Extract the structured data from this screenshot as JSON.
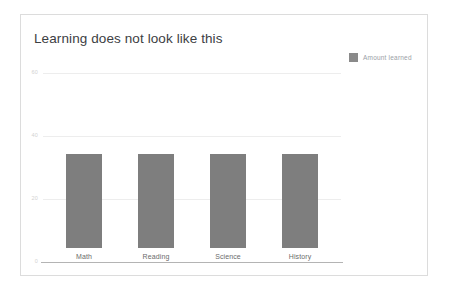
{
  "card": {
    "title": "Learning does not look like this",
    "background": "#ffffff",
    "border_color": "#dcdcdc"
  },
  "legend": {
    "position": "top-right",
    "entries": [
      {
        "label": "Amount learned",
        "color": "#8a8a8a",
        "swatch": "legend-swatch-icon"
      }
    ]
  },
  "chart_data": {
    "type": "bar",
    "title": "Learning does not look like this",
    "categories": [
      "Math",
      "Reading",
      "Science",
      "History"
    ],
    "series": [
      {
        "name": "Amount learned",
        "color": "#7e7e7e",
        "values": [
          30,
          30,
          30,
          30
        ]
      }
    ],
    "values": [
      30,
      30,
      30,
      30
    ],
    "xlabel": "",
    "ylabel": "",
    "ylim": [
      0,
      60
    ],
    "yticks": [
      0,
      20,
      40,
      60
    ],
    "ytick_labels": [
      "0",
      "20",
      "40",
      "60"
    ],
    "grid": true,
    "grid_color": "#ededed",
    "axis_color": "#b4b4b4",
    "legend_position": "top-right"
  }
}
